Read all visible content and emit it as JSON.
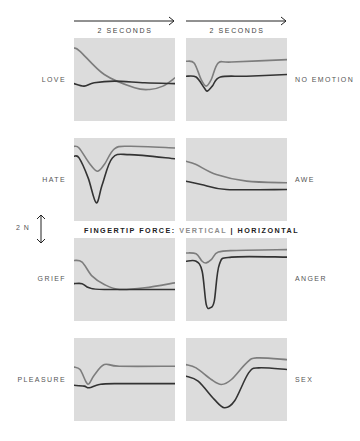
{
  "chart_data": {
    "type": "line",
    "legend": {
      "prefix": "FINGERTIP FORCE:",
      "vertical": "VERTICAL",
      "separator": "|",
      "horizontal": "HORIZONTAL",
      "colors": {
        "vertical": "#7d7d7d",
        "horizontal": "#333333"
      }
    },
    "time_axis": [
      "2 SECONDS",
      "2 SECONDS"
    ],
    "scale_bar": "2 N",
    "panel_background": "#dcdcdc",
    "panels": [
      {
        "emotion": "LOVE",
        "row": 0,
        "col": 0,
        "vertical": [
          [
            0,
            12
          ],
          [
            6,
            16
          ],
          [
            30,
            44
          ],
          [
            60,
            60
          ],
          [
            75,
            62
          ],
          [
            88,
            58
          ],
          [
            100,
            48
          ]
        ],
        "horizontal": [
          [
            0,
            55
          ],
          [
            10,
            58
          ],
          [
            20,
            54
          ],
          [
            40,
            52
          ],
          [
            70,
            54
          ],
          [
            100,
            55
          ]
        ]
      },
      {
        "emotion": "NO EMOTION",
        "row": 0,
        "col": 1,
        "vertical": [
          [
            0,
            28
          ],
          [
            8,
            30
          ],
          [
            15,
            50
          ],
          [
            20,
            58
          ],
          [
            25,
            50
          ],
          [
            32,
            30
          ],
          [
            45,
            29
          ],
          [
            100,
            26
          ]
        ],
        "horizontal": [
          [
            0,
            46
          ],
          [
            10,
            47
          ],
          [
            18,
            60
          ],
          [
            21,
            64
          ],
          [
            26,
            58
          ],
          [
            34,
            47
          ],
          [
            60,
            46
          ],
          [
            100,
            44
          ]
        ]
      },
      {
        "emotion": "HATE",
        "row": 1,
        "col": 0,
        "vertical": [
          [
            0,
            10
          ],
          [
            5,
            12
          ],
          [
            15,
            30
          ],
          [
            23,
            40
          ],
          [
            30,
            32
          ],
          [
            40,
            13
          ],
          [
            55,
            10
          ],
          [
            100,
            12
          ]
        ],
        "horizontal": [
          [
            0,
            22
          ],
          [
            5,
            24
          ],
          [
            14,
            48
          ],
          [
            22,
            78
          ],
          [
            28,
            56
          ],
          [
            38,
            24
          ],
          [
            55,
            20
          ],
          [
            100,
            25
          ]
        ]
      },
      {
        "emotion": "AWE",
        "row": 1,
        "col": 1,
        "vertical": [
          [
            0,
            28
          ],
          [
            10,
            32
          ],
          [
            30,
            44
          ],
          [
            60,
            52
          ],
          [
            100,
            54
          ]
        ],
        "horizontal": [
          [
            0,
            52
          ],
          [
            15,
            56
          ],
          [
            40,
            62
          ],
          [
            100,
            62
          ]
        ]
      },
      {
        "emotion": "GRIEF",
        "row": 2,
        "col": 0,
        "vertical": [
          [
            0,
            27
          ],
          [
            8,
            29
          ],
          [
            18,
            46
          ],
          [
            30,
            56
          ],
          [
            45,
            62
          ],
          [
            70,
            60
          ],
          [
            100,
            54
          ]
        ],
        "horizontal": [
          [
            0,
            55
          ],
          [
            8,
            55
          ],
          [
            15,
            60
          ],
          [
            30,
            62
          ],
          [
            100,
            62
          ]
        ]
      },
      {
        "emotion": "ANGER",
        "row": 2,
        "col": 1,
        "vertical": [
          [
            0,
            18
          ],
          [
            10,
            19
          ],
          [
            16,
            28
          ],
          [
            20,
            30
          ],
          [
            25,
            26
          ],
          [
            32,
            17
          ],
          [
            50,
            15
          ],
          [
            100,
            14
          ]
        ],
        "horizontal": [
          [
            0,
            28
          ],
          [
            10,
            28
          ],
          [
            16,
            40
          ],
          [
            20,
            80
          ],
          [
            24,
            84
          ],
          [
            28,
            76
          ],
          [
            33,
            32
          ],
          [
            45,
            23
          ],
          [
            100,
            23
          ]
        ]
      },
      {
        "emotion": "PLEASURE",
        "row": 3,
        "col": 0,
        "vertical": [
          [
            0,
            35
          ],
          [
            6,
            38
          ],
          [
            12,
            53
          ],
          [
            15,
            55
          ],
          [
            20,
            45
          ],
          [
            30,
            32
          ],
          [
            45,
            34
          ],
          [
            100,
            34
          ]
        ],
        "horizontal": [
          [
            0,
            57
          ],
          [
            10,
            58
          ],
          [
            15,
            60
          ],
          [
            25,
            56
          ],
          [
            40,
            55
          ],
          [
            100,
            55
          ]
        ]
      },
      {
        "emotion": "SEX",
        "row": 3,
        "col": 1,
        "vertical": [
          [
            0,
            32
          ],
          [
            10,
            36
          ],
          [
            25,
            50
          ],
          [
            35,
            56
          ],
          [
            45,
            50
          ],
          [
            60,
            30
          ],
          [
            70,
            24
          ],
          [
            100,
            26
          ]
        ],
        "horizontal": [
          [
            0,
            46
          ],
          [
            12,
            52
          ],
          [
            28,
            74
          ],
          [
            38,
            84
          ],
          [
            48,
            76
          ],
          [
            62,
            42
          ],
          [
            72,
            36
          ],
          [
            100,
            38
          ]
        ]
      }
    ],
    "xlabel": "time (2 seconds per panel)",
    "ylabel": "force (scale bar 2 N)"
  },
  "labels": {
    "time_left": "2 SECONDS",
    "time_right": "2 SECONDS",
    "scale": "2 N",
    "legend_prefix": "FINGERTIP FORCE: ",
    "legend_vertical": "VERTICAL",
    "legend_sep": " | ",
    "legend_horizontal": "HORIZONTAL",
    "emotions": [
      "LOVE",
      "NO EMOTION",
      "HATE",
      "AWE",
      "GRIEF",
      "ANGER",
      "PLEASURE",
      "SEX"
    ]
  }
}
